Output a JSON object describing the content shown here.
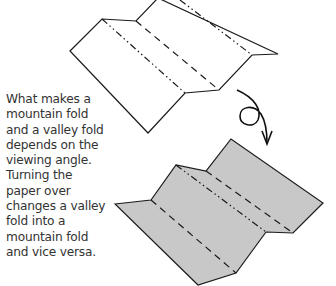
{
  "caption": {
    "lines": [
      "What makes a",
      "mountain fold",
      "and a valley fold",
      "depends on the",
      "viewing angle.",
      "Turning the",
      "paper over",
      "changes a valley",
      "fold into a",
      "mountain fold",
      "and vice versa."
    ]
  },
  "diagrams": {
    "top": {
      "fill": "#ffffff",
      "label": "folded paper, front view"
    },
    "bottom": {
      "fill": "#c8c8c8",
      "label": "folded paper, turned over"
    },
    "turn_over_symbol": "turn-over arrow"
  },
  "colors": {
    "line": "#1a1a1a",
    "text": "#333333",
    "shaded": "#c8c8c8"
  }
}
